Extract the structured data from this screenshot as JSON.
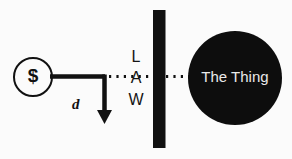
{
  "diagram": {
    "background_color": "#fbfbfb",
    "ink_color": "#111111",
    "money_node": {
      "label": "$",
      "shape": "circle-outline",
      "center_x": 33,
      "center_y": 77,
      "radius": 19,
      "stroke_color": "#111111",
      "fill_color": "#fbfbfb"
    },
    "connector_solid": {
      "name": "money-to-corner-line",
      "from_x": 50,
      "from_y": 76,
      "to_x": 105,
      "to_y": 76,
      "color": "#111111",
      "width": 4
    },
    "distance_arrow": {
      "label": "d",
      "from_x": 105,
      "from_y": 76,
      "to_x": 105,
      "to_y": 123,
      "color": "#111111",
      "width": 4,
      "head": "filled-triangle"
    },
    "dotted_line": {
      "name": "line-of-sight",
      "from_x": 108,
      "from_y": 76,
      "to_x": 190,
      "to_y": 76,
      "color": "#111111",
      "dash": "2 5",
      "width": 3
    },
    "barrier": {
      "name": "law-barrier",
      "x": 153,
      "y": 10,
      "width": 12,
      "height": 138,
      "fill_color": "#111111"
    },
    "law_letters": [
      "L",
      "A",
      "W"
    ],
    "thing_node": {
      "label": "The Thing",
      "shape": "circle-filled",
      "center_x": 235,
      "center_y": 78,
      "radius": 47,
      "fill_color": "#0d0d0d",
      "text_color": "#e9e9e9"
    }
  }
}
